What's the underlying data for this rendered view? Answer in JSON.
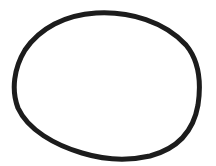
{
  "drawing": {
    "description": "Hand-drawn closed oval outline",
    "shape": "oval",
    "stroke_color": "#1c1c1c",
    "background_color": "#ffffff",
    "stroke_width": 5
  }
}
